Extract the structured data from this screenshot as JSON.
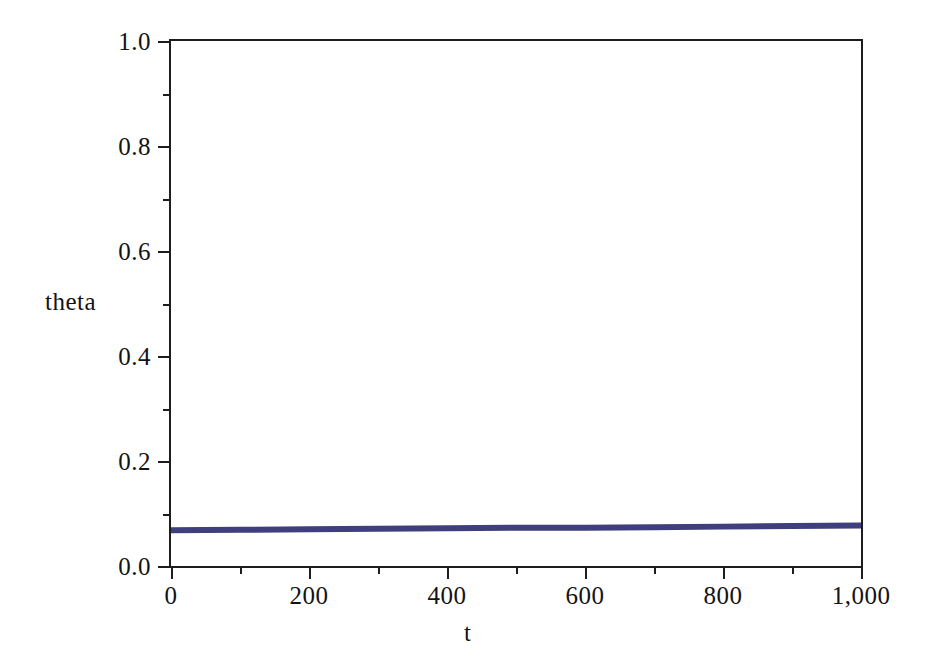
{
  "chart_data": {
    "type": "line",
    "title": "",
    "xlabel": "t",
    "ylabel": "theta",
    "xlim": [
      0,
      1000
    ],
    "ylim": [
      0.0,
      1.0
    ],
    "grid": false,
    "legend": null,
    "x_ticks": [
      {
        "value": 0,
        "label": "0",
        "major": true
      },
      {
        "value": 100,
        "label": "",
        "major": false
      },
      {
        "value": 200,
        "label": "200",
        "major": true
      },
      {
        "value": 300,
        "label": "",
        "major": false
      },
      {
        "value": 400,
        "label": "400",
        "major": true
      },
      {
        "value": 500,
        "label": "",
        "major": false
      },
      {
        "value": 600,
        "label": "600",
        "major": true
      },
      {
        "value": 700,
        "label": "",
        "major": false
      },
      {
        "value": 800,
        "label": "800",
        "major": true
      },
      {
        "value": 900,
        "label": "",
        "major": false
      },
      {
        "value": 1000,
        "label": "1,000",
        "major": true
      }
    ],
    "y_ticks": [
      {
        "value": 0.0,
        "label": "0.0",
        "major": true
      },
      {
        "value": 0.1,
        "label": "",
        "major": false
      },
      {
        "value": 0.2,
        "label": "0.2",
        "major": true
      },
      {
        "value": 0.3,
        "label": "",
        "major": false
      },
      {
        "value": 0.4,
        "label": "0.4",
        "major": true
      },
      {
        "value": 0.5,
        "label": "",
        "major": false
      },
      {
        "value": 0.6,
        "label": "0.6",
        "major": true
      },
      {
        "value": 0.7,
        "label": "",
        "major": false
      },
      {
        "value": 0.8,
        "label": "0.8",
        "major": true
      },
      {
        "value": 0.9,
        "label": "",
        "major": false
      },
      {
        "value": 1.0,
        "label": "1.0",
        "major": true
      }
    ],
    "series": [
      {
        "name": "theta",
        "color": "#3f3f7d",
        "line_width": 6,
        "x": [
          0,
          100,
          200,
          300,
          400,
          500,
          600,
          700,
          800,
          900,
          1000
        ],
        "values": [
          0.068,
          0.069,
          0.07,
          0.071,
          0.072,
          0.073,
          0.073,
          0.074,
          0.075,
          0.076,
          0.077
        ]
      }
    ]
  },
  "colors": {
    "axis": "#1d1d1d",
    "series": "#3f3f7d",
    "background": "#ffffff"
  }
}
